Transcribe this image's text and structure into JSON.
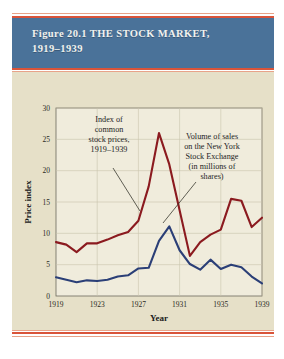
{
  "figure": {
    "title_line1": "Figure 20.1 THE STOCK MARKET,",
    "title_line2": "1919–1939",
    "band_color": "#4a7299",
    "rule_color": "#d9543a",
    "panel_color": "#e6e0c8"
  },
  "annotations": {
    "left": {
      "lines": [
        "Index of",
        "common",
        "stock prices,",
        "1919–1939"
      ]
    },
    "right": {
      "lines": [
        "Volume of sales",
        "on the New York",
        "Stock Exchange",
        "(in millions of",
        "shares)"
      ]
    }
  },
  "chart_data": {
    "type": "line",
    "title": "Figure 20.1 THE STOCK MARKET, 1919–1939",
    "xlabel": "Year",
    "ylabel": "Price index",
    "xlim": [
      1919,
      1939
    ],
    "ylim": [
      0,
      30
    ],
    "xticks": [
      1919,
      1923,
      1927,
      1931,
      1935,
      1939
    ],
    "xticklabels": [
      "1919",
      "1923",
      "1927",
      "1931",
      "1935",
      "1939"
    ],
    "yticks": [
      0,
      5,
      10,
      15,
      20,
      25,
      30
    ],
    "yticklabels": [
      "0",
      "5",
      "10",
      "15",
      "20",
      "25",
      "30"
    ],
    "grid": true,
    "legend": "annotations",
    "x": [
      1919,
      1920,
      1921,
      1922,
      1923,
      1924,
      1925,
      1926,
      1927,
      1928,
      1929,
      1930,
      1931,
      1932,
      1933,
      1934,
      1935,
      1936,
      1937,
      1938,
      1939
    ],
    "series": [
      {
        "name": "Index of common stock prices, 1919–1939",
        "color": "#8b1a1f",
        "values": [
          8.6,
          8.2,
          7.0,
          8.4,
          8.4,
          9.0,
          9.7,
          10.2,
          12.0,
          17.5,
          26.0,
          21.0,
          13.7,
          6.4,
          8.6,
          9.8,
          10.6,
          15.5,
          15.2,
          11.0,
          12.5
        ]
      },
      {
        "name": "Volume of sales on the New York Stock Exchange (in millions of shares)",
        "color": "#2b3f77",
        "values": [
          3.0,
          2.6,
          2.2,
          2.5,
          2.4,
          2.6,
          3.1,
          3.3,
          4.4,
          4.5,
          8.8,
          11.1,
          7.3,
          5.1,
          4.2,
          5.8,
          4.3,
          5.0,
          4.6,
          3.1,
          2.0
        ]
      }
    ]
  }
}
